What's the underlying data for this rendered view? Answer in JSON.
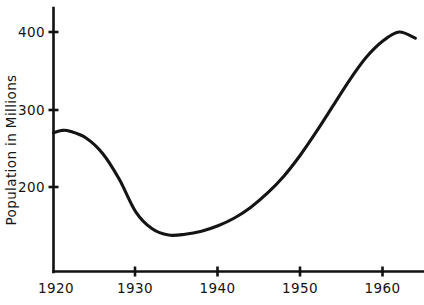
{
  "chart_data": {
    "type": "line",
    "title": "",
    "subtitle": "",
    "xlabel": "",
    "ylabel": "Population in Millions",
    "xlim": [
      1920,
      1964.5
    ],
    "ylim": [
      120,
      420
    ],
    "xticks": [
      1920,
      1930,
      1940,
      1950,
      1960
    ],
    "xticklabels": [
      "1920",
      "1930",
      "1940",
      "1950",
      "1960"
    ],
    "yticks": [
      200,
      300,
      400
    ],
    "yticklabels": [
      "200",
      "300",
      "400"
    ],
    "grid": false,
    "legend": null,
    "annotations": [],
    "series": [
      {
        "name": "Population",
        "color": "#141414",
        "x": [
          1920,
          1921,
          1922,
          1924,
          1926,
          1928,
          1930,
          1932,
          1934,
          1936,
          1938,
          1940,
          1942,
          1944,
          1946,
          1948,
          1950,
          1952,
          1954,
          1956,
          1958,
          1960,
          1962,
          1964
        ],
        "y": [
          270,
          273,
          272,
          263,
          243,
          210,
          168,
          146,
          138,
          139,
          143,
          150,
          160,
          174,
          192,
          214,
          241,
          272,
          305,
          338,
          367,
          388,
          400,
          392
        ]
      }
    ]
  },
  "axis_titles": {
    "y": "Population in Millions"
  },
  "tick_labels": {
    "y": [
      "400",
      "300",
      "200"
    ],
    "x": [
      "1920",
      "1930",
      "1940",
      "1950",
      "1960"
    ]
  },
  "colors": {
    "line": "#141414",
    "axis": "#111111",
    "background": "#ffffff",
    "text": "#141414"
  }
}
